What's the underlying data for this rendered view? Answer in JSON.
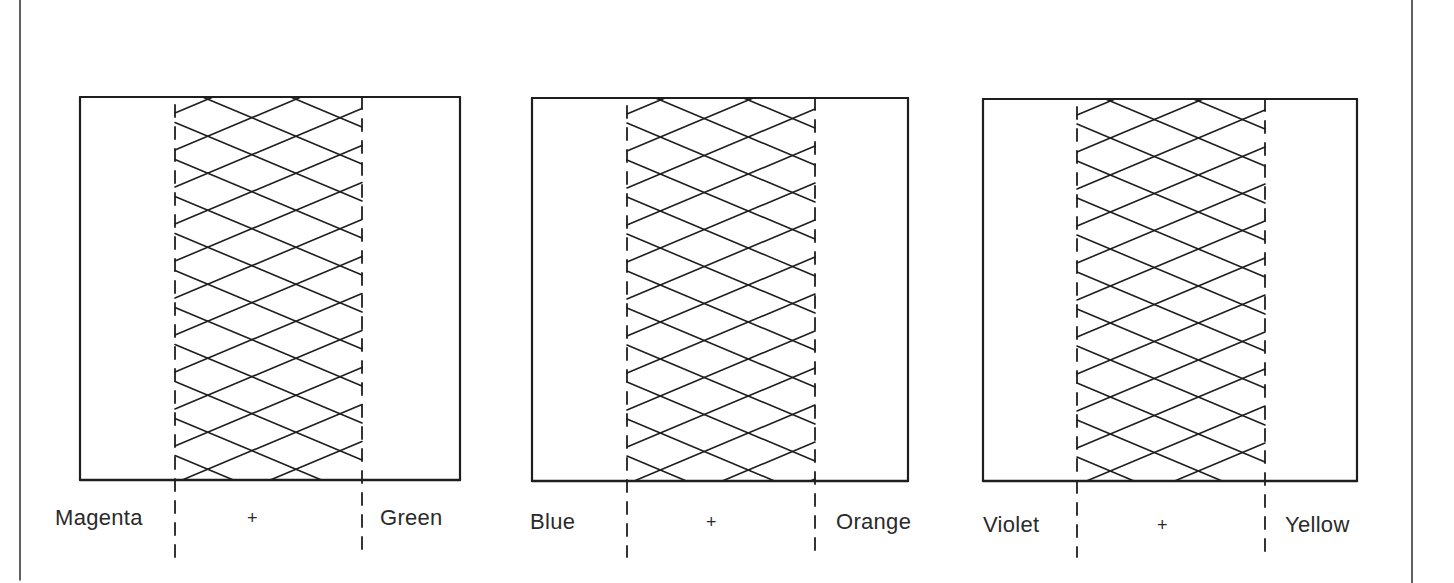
{
  "figure": {
    "stroke_color": "#1e1e1e",
    "panels": [
      {
        "left_label": "Magenta",
        "operator": "+",
        "right_label": "Green",
        "box": {
          "x1": 80,
          "y1": 97,
          "x2": 460,
          "y2": 480
        },
        "dash_left_x": 175,
        "dash_right_x": 362,
        "label_y": 518
      },
      {
        "left_label": "Blue",
        "operator": "+",
        "right_label": "Orange",
        "box": {
          "x1": 532,
          "y1": 98,
          "x2": 908,
          "y2": 481
        },
        "dash_left_x": 627,
        "dash_right_x": 815,
        "label_y": 521
      },
      {
        "left_label": "Violet",
        "operator": "+",
        "right_label": "Yellow",
        "box": {
          "x1": 983,
          "y1": 99,
          "x2": 1357,
          "y2": 481
        },
        "dash_left_x": 1077,
        "dash_right_x": 1265,
        "label_y": 524
      }
    ]
  }
}
